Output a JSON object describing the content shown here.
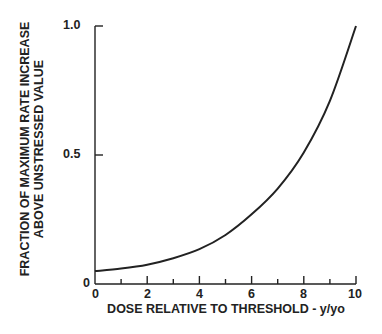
{
  "chart_data": {
    "type": "line",
    "title": "",
    "xlabel": "DOSE RELATIVE TO THRESHOLD - y/yo",
    "ylabel_line1": "FRACTION OF MAXIMUM RATE INCREASE",
    "ylabel_line2": "ABOVE UNSTRESSED VALUE",
    "xlim": [
      0,
      10
    ],
    "ylim": [
      0,
      1.0
    ],
    "x_ticks": [
      "0",
      "2",
      "4",
      "6",
      "8",
      "10"
    ],
    "y_ticks": [
      "0",
      "0.5",
      "1.0"
    ],
    "grid": false,
    "legend": "none",
    "series": [
      {
        "name": "response",
        "x": [
          0,
          1,
          2,
          3,
          4,
          5,
          6,
          7,
          8,
          9,
          10
        ],
        "y": [
          0.05,
          0.06,
          0.075,
          0.1,
          0.135,
          0.19,
          0.27,
          0.37,
          0.51,
          0.71,
          1.0
        ]
      }
    ]
  }
}
